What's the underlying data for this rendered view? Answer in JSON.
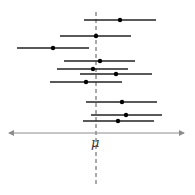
{
  "chart_data": {
    "type": "confidence-intervals",
    "title": "",
    "xlabel": "μ",
    "axis": {
      "x_start": 9,
      "x_end": 184,
      "y": 133,
      "color": "#8c8c8c",
      "arrows": "both"
    },
    "reference_line": {
      "label": "μ",
      "x": 96,
      "y_start": 12,
      "y_end": 186,
      "style": "dashed",
      "color": "#555555"
    },
    "intervals": [
      {
        "y": 20,
        "low": 84,
        "estimate": 120,
        "high": 156
      },
      {
        "y": 36,
        "low": 60,
        "estimate": 96,
        "high": 131
      },
      {
        "y": 48,
        "low": 17,
        "estimate": 53,
        "high": 89
      },
      {
        "y": 61,
        "low": 64,
        "estimate": 100,
        "high": 135
      },
      {
        "y": 69,
        "low": 57,
        "estimate": 93,
        "high": 128
      },
      {
        "y": 74,
        "low": 80,
        "estimate": 116,
        "high": 152
      },
      {
        "y": 82,
        "low": 50,
        "estimate": 86,
        "high": 122
      },
      {
        "y": 102,
        "low": 86,
        "estimate": 122,
        "high": 157
      },
      {
        "y": 115,
        "low": 91,
        "estimate": 126,
        "high": 162
      },
      {
        "y": 121,
        "low": 83,
        "estimate": 118,
        "high": 154
      }
    ],
    "interval_color": "#222222",
    "point_color": "#000000"
  },
  "labels": {
    "mu": "μ"
  }
}
